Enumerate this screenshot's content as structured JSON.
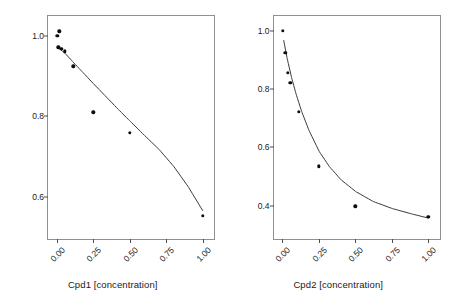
{
  "chart_data": [
    {
      "type": "scatter",
      "title": "",
      "xlabel": "Cpd1 [concentration]",
      "ylabel": "Mean normalized assay signal",
      "xlim": [
        -0.06,
        1.09
      ],
      "ylim": [
        0.49,
        1.05
      ],
      "xticks": [
        0.0,
        0.25,
        0.5,
        0.75,
        1.0
      ],
      "xticklabels": [
        "0.00",
        "0.25",
        "0.50",
        "0.75",
        "1.00"
      ],
      "yticks": [
        1.0,
        0.8,
        0.6
      ],
      "yticklabels": [
        "1.0",
        "0.8",
        "0.6"
      ],
      "grid": false,
      "legend": "none",
      "marker_color": "#0d0d0d",
      "line_color": "#3a3a3a",
      "points": [
        {
          "x": 0.004,
          "y": 1.0
        },
        {
          "x": 0.018,
          "y": 1.012
        },
        {
          "x": 0.01,
          "y": 0.972
        },
        {
          "x": 0.03,
          "y": 0.968
        },
        {
          "x": 0.056,
          "y": 0.962
        },
        {
          "x": 0.112,
          "y": 0.925
        },
        {
          "x": 0.25,
          "y": 0.81
        },
        {
          "x": 0.5,
          "y": 0.76
        },
        {
          "x": 1.0,
          "y": 0.552
        }
      ],
      "fit_curve": [
        {
          "x": 0.02,
          "y": 0.968
        },
        {
          "x": 0.06,
          "y": 0.956
        },
        {
          "x": 0.11,
          "y": 0.936
        },
        {
          "x": 0.17,
          "y": 0.913
        },
        {
          "x": 0.25,
          "y": 0.882
        },
        {
          "x": 0.33,
          "y": 0.852
        },
        {
          "x": 0.42,
          "y": 0.818
        },
        {
          "x": 0.5,
          "y": 0.789
        },
        {
          "x": 0.6,
          "y": 0.753
        },
        {
          "x": 0.7,
          "y": 0.718
        },
        {
          "x": 0.8,
          "y": 0.676
        },
        {
          "x": 0.9,
          "y": 0.625
        },
        {
          "x": 1.0,
          "y": 0.565
        }
      ]
    },
    {
      "type": "scatter",
      "title": "",
      "xlabel": "Cpd2 [concentration]",
      "ylabel": "Mean normalized assay signal",
      "xlim": [
        -0.06,
        1.09
      ],
      "ylim": [
        0.28,
        1.05
      ],
      "xticks": [
        0.0,
        0.25,
        0.5,
        0.75,
        1.0
      ],
      "xticklabels": [
        "0.00",
        "0.25",
        "0.50",
        "0.75",
        "1.00"
      ],
      "yticks": [
        1.0,
        0.8,
        0.6,
        0.4
      ],
      "yticklabels": [
        "1.0",
        "0.8",
        "0.6",
        "0.4"
      ],
      "grid": false,
      "legend": "none",
      "marker_color": "#0d0d0d",
      "line_color": "#3a3a3a",
      "points": [
        {
          "x": 0.004,
          "y": 1.0
        },
        {
          "x": 0.02,
          "y": 0.925
        },
        {
          "x": 0.036,
          "y": 0.856
        },
        {
          "x": 0.056,
          "y": 0.822
        },
        {
          "x": 0.112,
          "y": 0.722
        },
        {
          "x": 0.25,
          "y": 0.535
        },
        {
          "x": 0.5,
          "y": 0.399
        },
        {
          "x": 1.0,
          "y": 0.362
        }
      ],
      "fit_curve": [
        {
          "x": 0.006,
          "y": 0.968
        },
        {
          "x": 0.03,
          "y": 0.905
        },
        {
          "x": 0.06,
          "y": 0.84
        },
        {
          "x": 0.09,
          "y": 0.785
        },
        {
          "x": 0.13,
          "y": 0.722
        },
        {
          "x": 0.18,
          "y": 0.658
        },
        {
          "x": 0.25,
          "y": 0.586
        },
        {
          "x": 0.32,
          "y": 0.534
        },
        {
          "x": 0.4,
          "y": 0.489
        },
        {
          "x": 0.5,
          "y": 0.449
        },
        {
          "x": 0.62,
          "y": 0.415
        },
        {
          "x": 0.75,
          "y": 0.391
        },
        {
          "x": 0.88,
          "y": 0.373
        },
        {
          "x": 1.0,
          "y": 0.358
        }
      ]
    }
  ]
}
